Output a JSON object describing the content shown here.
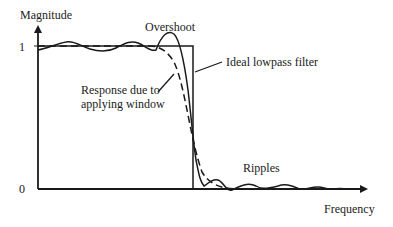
{
  "diagram": {
    "type": "filter-frequency-response",
    "axes": {
      "y_label": "Magnitude",
      "x_label": "Frequency",
      "y_ticks": [
        "1",
        "0"
      ]
    },
    "annotations": {
      "overshoot": "Overshoot",
      "ideal": "Ideal lowpass filter",
      "window_line1": "Response due to",
      "window_line2": "applying window",
      "ripples": "Ripples"
    },
    "series": [
      {
        "name": "Ideal lowpass filter",
        "style": "solid",
        "shape": "rectangle"
      },
      {
        "name": "Response with ripples (rectangular window)",
        "style": "solid",
        "shape": "oscillating"
      },
      {
        "name": "Response due to applying window",
        "style": "dashed",
        "shape": "smooth"
      }
    ],
    "colors": {
      "line": "#1a1a1a",
      "background": "#ffffff"
    }
  }
}
